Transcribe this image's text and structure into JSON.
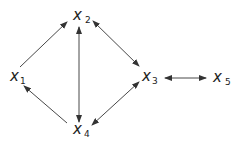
{
  "diagram": {
    "type": "directed-graph",
    "nodes": [
      {
        "id": "x1",
        "base": "x",
        "sub": "1",
        "x": 10,
        "y": 80
      },
      {
        "id": "x2",
        "base": "x",
        "sub": "2",
        "x": 74,
        "y": 20
      },
      {
        "id": "x3",
        "base": "x",
        "sub": "3",
        "x": 142,
        "y": 80
      },
      {
        "id": "x4",
        "base": "x",
        "sub": "4",
        "x": 74,
        "y": 135
      },
      {
        "id": "x5",
        "base": "x",
        "sub": "5",
        "x": 213,
        "y": 82
      }
    ],
    "edges": [
      {
        "from": "x1",
        "to": "x2",
        "bidirectional": false
      },
      {
        "from": "x2",
        "to": "x4",
        "bidirectional": true
      },
      {
        "from": "x2",
        "to": "x3",
        "bidirectional": true
      },
      {
        "from": "x3",
        "to": "x5",
        "bidirectional": true
      },
      {
        "from": "x4",
        "to": "x3",
        "bidirectional": true
      },
      {
        "from": "x4",
        "to": "x1",
        "bidirectional": false
      }
    ],
    "colors": {
      "line": "#333333",
      "text": "#222222",
      "background": "#ffffff"
    }
  }
}
